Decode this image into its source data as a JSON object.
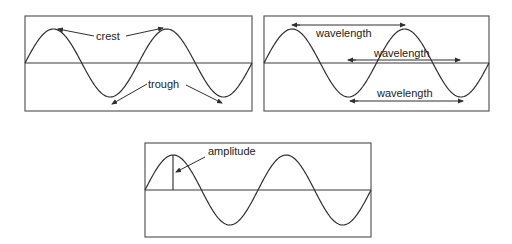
{
  "panels": {
    "crest_trough": {
      "labels": {
        "crest": "crest",
        "trough": "trough"
      }
    },
    "wavelength": {
      "labels": {
        "top": "wavelength",
        "middle": "wavelength",
        "bottom": "wavelength"
      }
    },
    "amplitude": {
      "labels": {
        "amplitude": "amplitude"
      }
    }
  },
  "colors": {
    "stroke": "#2f2f2f",
    "background": "#ffffff"
  }
}
